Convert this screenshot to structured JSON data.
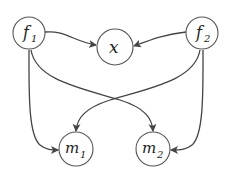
{
  "diagram": {
    "type": "directed-graph",
    "nodes": [
      {
        "id": "f1",
        "label": "f",
        "sub": "1",
        "cx": 29,
        "cy": 33
      },
      {
        "id": "x",
        "label": "x",
        "sub": "",
        "cx": 115,
        "cy": 47
      },
      {
        "id": "f2",
        "label": "f",
        "sub": "2",
        "cx": 202,
        "cy": 33
      },
      {
        "id": "m1",
        "label": "m",
        "sub": "1",
        "cx": 76,
        "cy": 149
      },
      {
        "id": "m2",
        "label": "m",
        "sub": "2",
        "cx": 153,
        "cy": 149
      }
    ],
    "edges": [
      {
        "from": "f1",
        "to": "x"
      },
      {
        "from": "f2",
        "to": "x"
      },
      {
        "from": "f1",
        "to": "m1"
      },
      {
        "from": "f1",
        "to": "m2"
      },
      {
        "from": "f2",
        "to": "m1"
      },
      {
        "from": "f2",
        "to": "m2"
      }
    ]
  }
}
